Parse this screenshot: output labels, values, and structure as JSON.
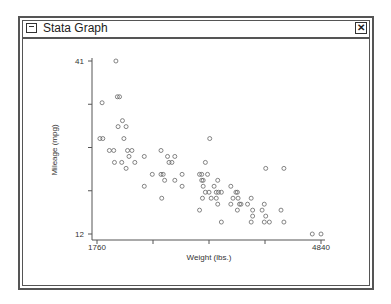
{
  "window": {
    "title": "Stata Graph",
    "close_label": "✕",
    "menu_icon": "window-menu-icon",
    "close_icon": "close-icon"
  },
  "chart_data": {
    "type": "scatter",
    "title": "",
    "xlabel": "Weight (lbs.)",
    "ylabel": "Mileage (mpg)",
    "xlim": [
      1760,
      4840
    ],
    "ylim": [
      12,
      41
    ],
    "x_tick_labels": [
      "1760",
      "4840"
    ],
    "y_tick_labels": [
      "41",
      "12"
    ],
    "x_ticks": [
      1760,
      2530,
      3300,
      4070,
      4840
    ],
    "y_ticks": [
      12,
      19.25,
      26.5,
      33.75,
      41
    ],
    "grid": false,
    "legend": null,
    "marker": "hollow-circle",
    "points": [
      [
        2020,
        41
      ],
      [
        2040,
        35
      ],
      [
        2070,
        35
      ],
      [
        1830,
        34
      ],
      [
        2110,
        31
      ],
      [
        2160,
        30
      ],
      [
        2050,
        30
      ],
      [
        1800,
        28
      ],
      [
        1930,
        26
      ],
      [
        2130,
        28
      ],
      [
        2240,
        26
      ],
      [
        2200,
        25
      ],
      [
        1990,
        26
      ],
      [
        1840,
        28
      ],
      [
        2180,
        26
      ],
      [
        2410,
        25
      ],
      [
        2100,
        24
      ],
      [
        2000,
        24
      ],
      [
        2280,
        24
      ],
      [
        2160,
        23
      ],
      [
        2640,
        26
      ],
      [
        2730,
        25
      ],
      [
        2830,
        25
      ],
      [
        2790,
        24
      ],
      [
        2750,
        24
      ],
      [
        2930,
        22
      ],
      [
        3170,
        22
      ],
      [
        2640,
        22
      ],
      [
        2670,
        22
      ],
      [
        2520,
        22
      ],
      [
        3250,
        24
      ],
      [
        2690,
        21
      ],
      [
        2410,
        20
      ],
      [
        2830,
        21
      ],
      [
        2930,
        20
      ],
      [
        3220,
        21
      ],
      [
        3310,
        28
      ],
      [
        3280,
        22
      ],
      [
        3200,
        21
      ],
      [
        3420,
        21
      ],
      [
        3600,
        20
      ],
      [
        3670,
        19
      ],
      [
        3690,
        19
      ],
      [
        3220,
        20
      ],
      [
        3370,
        20
      ],
      [
        3400,
        19
      ],
      [
        3430,
        19
      ],
      [
        3470,
        19
      ],
      [
        3300,
        19
      ],
      [
        3880,
        18
      ],
      [
        3250,
        19
      ],
      [
        3210,
        18
      ],
      [
        3330,
        18
      ],
      [
        3400,
        18
      ],
      [
        3630,
        18
      ],
      [
        3700,
        18
      ],
      [
        3720,
        17
      ],
      [
        3830,
        17
      ],
      [
        4060,
        17
      ],
      [
        3900,
        16
      ],
      [
        4290,
        16
      ],
      [
        4030,
        16
      ],
      [
        3740,
        17
      ],
      [
        3600,
        17
      ],
      [
        3420,
        17
      ],
      [
        3170,
        16
      ],
      [
        3690,
        16
      ],
      [
        3900,
        15
      ],
      [
        4080,
        15
      ],
      [
        4130,
        14
      ],
      [
        3470,
        14
      ],
      [
        3880,
        14
      ],
      [
        4060,
        14
      ],
      [
        4330,
        14
      ],
      [
        4720,
        12
      ],
      [
        4840,
        12
      ],
      [
        4080,
        23
      ],
      [
        4330,
        23
      ],
      [
        3200,
        22
      ],
      [
        2650,
        18
      ]
    ]
  }
}
